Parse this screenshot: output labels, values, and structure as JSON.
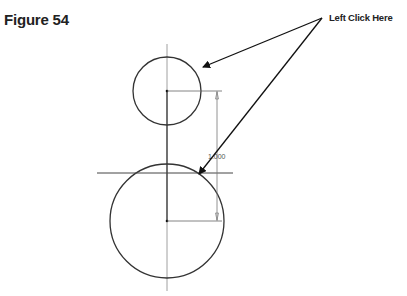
{
  "figure": {
    "title": "Figure 54",
    "callout_label": "Left Click Here"
  },
  "drawing": {
    "dimension_value": "1.000",
    "small_circle": {
      "cx": 167,
      "cy": 91,
      "r": 34
    },
    "large_circle": {
      "cx": 167,
      "cy": 221,
      "r": 57
    },
    "horizontal_line": {
      "x1": 97,
      "x2": 233,
      "y": 173
    },
    "colors": {
      "stroke": "#333333",
      "thin": "#777777",
      "text": "#222222"
    }
  }
}
